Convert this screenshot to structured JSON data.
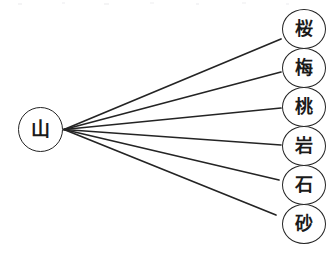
{
  "diagram": {
    "type": "radial-tree",
    "title": "",
    "background_color": "#ffffff",
    "stroke_color": "#242424",
    "text_color": "#1a1a1a",
    "root": {
      "label": "山",
      "name": "node-yama",
      "cx": 40,
      "cy": 129.5,
      "rx": 22.5,
      "ry": 22.5
    },
    "hub": {
      "x": 64,
      "y": 129.5
    },
    "leaves": [
      {
        "label": "桜",
        "name": "node-sakura",
        "cx": 304,
        "cy": 29,
        "top": 9,
        "edge_end_x": 281,
        "edge_end_y": 39
      },
      {
        "label": "梅",
        "name": "node-ume",
        "cx": 304,
        "cy": 68,
        "top": 48,
        "edge_end_x": 281,
        "edge_end_y": 72
      },
      {
        "label": "桃",
        "name": "node-momo",
        "cx": 304,
        "cy": 107,
        "top": 87,
        "edge_end_x": 281,
        "edge_end_y": 108
      },
      {
        "label": "岩",
        "name": "node-iwa",
        "cx": 304,
        "cy": 146,
        "top": 126,
        "edge_end_x": 281,
        "edge_end_y": 145
      },
      {
        "label": "石",
        "name": "node-ishi",
        "cx": 304,
        "cy": 185,
        "top": 165,
        "edge_end_x": 279,
        "edge_end_y": 180
      },
      {
        "label": "砂",
        "name": "node-suna",
        "cx": 304,
        "cy": 224,
        "top": 204,
        "edge_end_x": 276,
        "edge_end_y": 215
      }
    ]
  }
}
